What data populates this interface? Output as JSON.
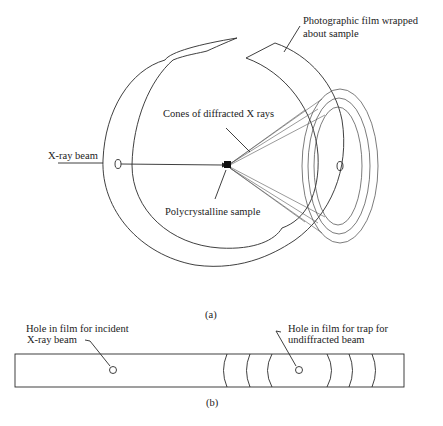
{
  "figure": {
    "part_a": {
      "caption": "(a)",
      "labels": {
        "film": [
          "Photographic film wrapped",
          "about sample"
        ],
        "cones": "Cones of diffracted X rays",
        "beam": "X-ray beam",
        "sample": "Polycrystalline sample"
      }
    },
    "part_b": {
      "caption": "(b)",
      "labels": {
        "incident_hole": [
          "Hole in film for incident",
          "X-ray beam"
        ],
        "trap_hole": [
          "Hole in film for trap for",
          "undiffracted beam"
        ]
      }
    }
  }
}
